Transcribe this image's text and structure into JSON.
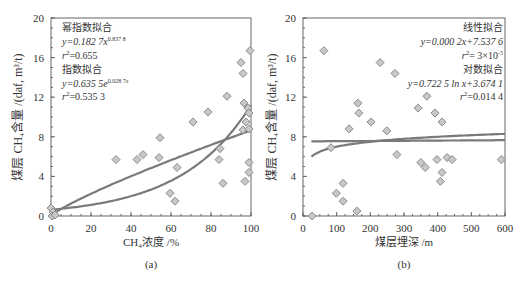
{
  "chart_data": [
    {
      "type": "scatter",
      "panel_label": "(a)",
      "xlabel": "CH₄浓度 /%",
      "ylabel": "煤层 CH₄含量 /(daf, m³/t)",
      "xlim": [
        0,
        100
      ],
      "ylim": [
        0,
        20
      ],
      "xticks": [
        "0",
        "20",
        "40",
        "60",
        "80",
        "100"
      ],
      "yticks": [
        "0",
        "4",
        "8",
        "12",
        "16",
        "20"
      ],
      "grid": false,
      "points": [
        [
          0,
          0.8
        ],
        [
          1,
          0.4
        ],
        [
          0.5,
          0
        ],
        [
          2,
          0.1
        ],
        [
          32.5,
          5.7
        ],
        [
          43,
          5.7
        ],
        [
          46,
          6.2
        ],
        [
          54,
          5.9
        ],
        [
          54.5,
          7.9
        ],
        [
          59.5,
          2.3
        ],
        [
          62,
          1.5
        ],
        [
          63,
          4.9
        ],
        [
          71,
          9.5
        ],
        [
          78.5,
          10.5
        ],
        [
          84,
          5.7
        ],
        [
          84.5,
          6.8
        ],
        [
          86,
          3.3
        ],
        [
          88,
          12.1
        ],
        [
          95,
          15.5
        ],
        [
          96,
          14.4
        ],
        [
          96,
          8.7
        ],
        [
          96.5,
          11.4
        ],
        [
          97,
          3.5
        ],
        [
          97.5,
          9.5
        ],
        [
          98.5,
          10.9
        ],
        [
          99,
          10.4
        ],
        [
          99,
          8.8
        ],
        [
          99,
          5.4
        ],
        [
          99,
          4.4
        ],
        [
          99.5,
          16.7
        ]
      ],
      "fits": [
        {
          "name": "幂指数拟合",
          "equation": "y=0.182 7x^0.837 8",
          "eq_base": "y=0.182 7",
          "eq_var": "x",
          "eq_exp": "0.837 8",
          "r2_label": "r",
          "r2_value": "=0.655",
          "a": 0.1827,
          "b": 0.8378,
          "kind": "power"
        },
        {
          "name": "指数拟合",
          "equation": "y=0.635 5e^0.028 7x",
          "eq_base": "y=0.635 5e",
          "eq_exp": "0.028 7",
          "eq_var": "x",
          "r2_label": "r",
          "r2_value": "=0.535 3",
          "a": 0.6355,
          "b": 0.0287,
          "kind": "exp"
        }
      ]
    },
    {
      "type": "scatter",
      "panel_label": "(b)",
      "xlabel": "煤层埋深 /m",
      "ylabel": "煤层 CH₄含量 /(daf, m³/t)",
      "xlim": [
        0,
        600
      ],
      "ylim": [
        0,
        20
      ],
      "xticks": [
        "0",
        "100",
        "200",
        "300",
        "400",
        "500",
        "600"
      ],
      "yticks": [
        "0",
        "4",
        "8",
        "12",
        "16",
        "20"
      ],
      "grid": false,
      "points": [
        [
          27,
          0
        ],
        [
          62,
          16.7
        ],
        [
          83,
          6.9
        ],
        [
          99,
          2.3
        ],
        [
          119,
          3.3
        ],
        [
          119,
          1.5
        ],
        [
          137,
          8.8
        ],
        [
          160,
          0.5
        ],
        [
          163,
          11.4
        ],
        [
          166,
          10.4
        ],
        [
          202,
          9.5
        ],
        [
          229,
          15.5
        ],
        [
          249,
          8.6
        ],
        [
          273,
          14.4
        ],
        [
          279,
          6.2
        ],
        [
          342,
          10.9
        ],
        [
          350,
          5.4
        ],
        [
          363,
          4.9
        ],
        [
          368,
          12.1
        ],
        [
          392,
          10.4
        ],
        [
          398,
          5.7
        ],
        [
          408,
          3.5
        ],
        [
          413,
          9.5
        ],
        [
          413,
          4.4
        ],
        [
          428,
          5.9
        ],
        [
          443,
          5.7
        ],
        [
          589,
          5.7
        ]
      ],
      "fits": [
        {
          "name": "线性拟合",
          "equation": "y=0.000 2x+7.537 6",
          "eq_text": "y=0.000 2x+7.537 6",
          "r2_label": "r",
          "r2_value": "= 3×10",
          "r2_exp": "-5",
          "a": 0.0002,
          "b": 7.5376,
          "kind": "linear"
        },
        {
          "name": "对数拟合",
          "equation": "y=0.722 5 ln x+3.674 1",
          "eq_text": "y=0.722 5 ln x+3.674 1",
          "r2_label": "r",
          "r2_value": "=0.014 4",
          "a": 0.7225,
          "b": 3.6741,
          "kind": "log"
        }
      ]
    }
  ],
  "style": {
    "marker_fill": "#c8c8c8",
    "marker_stroke": "#8a8a8a",
    "line_color": "#7a7a7a",
    "axis_color": "#555555"
  }
}
